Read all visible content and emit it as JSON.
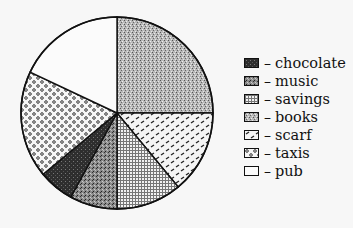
{
  "chart_data": {
    "type": "pie",
    "title": "",
    "start_angle_deg": 0,
    "direction": "clockwise",
    "slices": [
      {
        "label": "books",
        "value": 25,
        "pattern": "stipple-light"
      },
      {
        "label": "scarf",
        "value": 14,
        "pattern": "dashes"
      },
      {
        "label": "savings",
        "value": 11,
        "pattern": "crosshatch"
      },
      {
        "label": "music",
        "value": 8,
        "pattern": "stipple-dark"
      },
      {
        "label": "chocolate",
        "value": 6,
        "pattern": "dark"
      },
      {
        "label": "taxis",
        "value": 18,
        "pattern": "circles"
      },
      {
        "label": "pub",
        "value": 18,
        "pattern": "blank"
      }
    ],
    "legend": {
      "position": "right",
      "entries": [
        "chocolate",
        "music",
        "savings",
        "books",
        "scarf",
        "taxis",
        "pub"
      ]
    }
  },
  "legend": {
    "dash": "–",
    "items": [
      {
        "label": "chocolate",
        "pattern": "dark"
      },
      {
        "label": "music",
        "pattern": "stipple-dark"
      },
      {
        "label": "savings",
        "pattern": "crosshatch"
      },
      {
        "label": "books",
        "pattern": "stipple-light"
      },
      {
        "label": "scarf",
        "pattern": "dashes"
      },
      {
        "label": "taxis",
        "pattern": "circles"
      },
      {
        "label": "pub",
        "pattern": "blank"
      }
    ]
  },
  "colors": {
    "background": "#f7f7f7",
    "line": "#111111"
  }
}
